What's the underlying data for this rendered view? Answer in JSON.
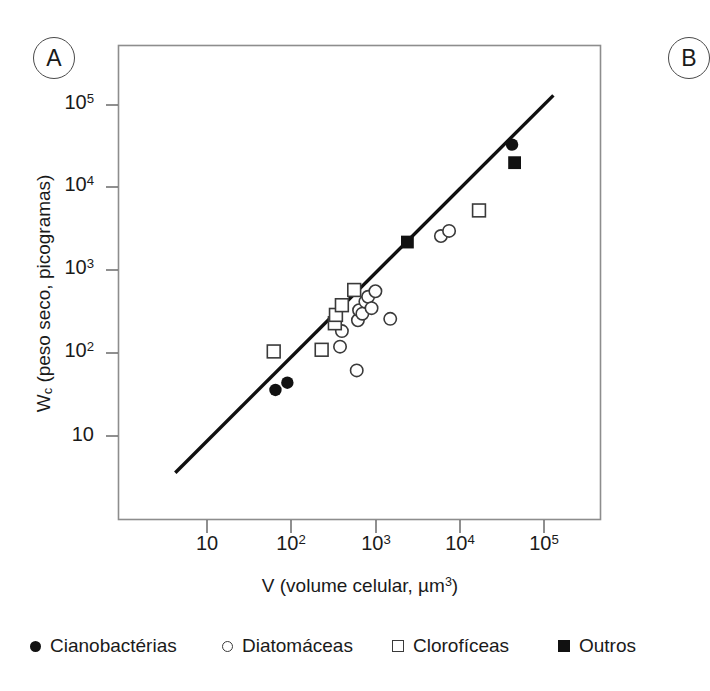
{
  "figure": {
    "panel_label": "A",
    "panel_label_right": "B"
  },
  "axes": {
    "y_title_prefix": "W",
    "y_title_subscript": "c",
    "y_title_rest": " (peso seco, picogramas)",
    "x_title_prefix": "V (volume celular, µm",
    "x_title_superscript": "3",
    "x_title_suffix": ")",
    "y_ticks": [
      {
        "base": "10",
        "exp": "5",
        "value": 100000
      },
      {
        "base": "10",
        "exp": "4",
        "value": 10000
      },
      {
        "base": "10",
        "exp": "3",
        "value": 1000
      },
      {
        "base": "10",
        "exp": "2",
        "value": 100
      },
      {
        "base": "10",
        "exp": "",
        "value": 10
      }
    ],
    "x_ticks": [
      {
        "base": "10",
        "exp": "",
        "value": 10
      },
      {
        "base": "10",
        "exp": "2",
        "value": 100
      },
      {
        "base": "10",
        "exp": "3",
        "value": 1000
      },
      {
        "base": "10",
        "exp": "4",
        "value": 10000
      },
      {
        "base": "10",
        "exp": "5",
        "value": 100000
      }
    ]
  },
  "legend": {
    "items": [
      {
        "label": "Cianobactérias",
        "marker": "filled-circle",
        "x": 0
      },
      {
        "label": "Diatomáceas",
        "marker": "open-circle",
        "x": 192
      },
      {
        "label": "Clorofíceas",
        "marker": "open-square",
        "x": 362
      },
      {
        "label": "Outros",
        "marker": "filled-square",
        "x": 528
      }
    ]
  },
  "colors": {
    "axis": "#5a5a5a",
    "marker_stroke": "#3a3a3a",
    "marker_fill": "#111111",
    "trend_line": "#101010",
    "background": "#ffffff"
  },
  "chart_data": {
    "type": "scatter",
    "title": "",
    "subtitle": "",
    "xlabel": "V (volume celular, µm³)",
    "ylabel": "Wc (peso seco, picogramas)",
    "xscale": "log",
    "yscale": "log",
    "xlim": [
      3,
      300000
    ],
    "ylim": [
      3,
      300000
    ],
    "grid": false,
    "legend_position": "below-plot",
    "series": [
      {
        "name": "Cianobactérias",
        "marker": "filled-circle",
        "points": [
          {
            "x": 65,
            "y": 36
          },
          {
            "x": 90,
            "y": 44
          },
          {
            "x": 42000,
            "y": 33000
          }
        ]
      },
      {
        "name": "Diatomáceas",
        "marker": "open-circle",
        "points": [
          {
            "x": 380,
            "y": 120
          },
          {
            "x": 400,
            "y": 185
          },
          {
            "x": 600,
            "y": 62
          },
          {
            "x": 620,
            "y": 250
          },
          {
            "x": 640,
            "y": 330
          },
          {
            "x": 700,
            "y": 300
          },
          {
            "x": 760,
            "y": 420
          },
          {
            "x": 820,
            "y": 480
          },
          {
            "x": 900,
            "y": 350
          },
          {
            "x": 1000,
            "y": 560
          },
          {
            "x": 1500,
            "y": 260
          },
          {
            "x": 6000,
            "y": 2600
          },
          {
            "x": 7500,
            "y": 3000
          }
        ]
      },
      {
        "name": "Clorofíceas",
        "marker": "open-square",
        "points": [
          {
            "x": 62,
            "y": 105
          },
          {
            "x": 230,
            "y": 110
          },
          {
            "x": 330,
            "y": 230
          },
          {
            "x": 340,
            "y": 290
          },
          {
            "x": 400,
            "y": 380
          },
          {
            "x": 560,
            "y": 580
          },
          {
            "x": 17000,
            "y": 5300
          }
        ]
      },
      {
        "name": "Outros",
        "marker": "filled-square",
        "points": [
          {
            "x": 2400,
            "y": 2200
          },
          {
            "x": 45000,
            "y": 20000
          }
        ]
      }
    ],
    "trend_line": {
      "label": "regression line",
      "points": [
        {
          "x": 4.2,
          "y": 3.6
        },
        {
          "x": 130000,
          "y": 130000
        }
      ]
    },
    "annotations": [
      {
        "text": "A",
        "type": "panel-label"
      }
    ]
  }
}
